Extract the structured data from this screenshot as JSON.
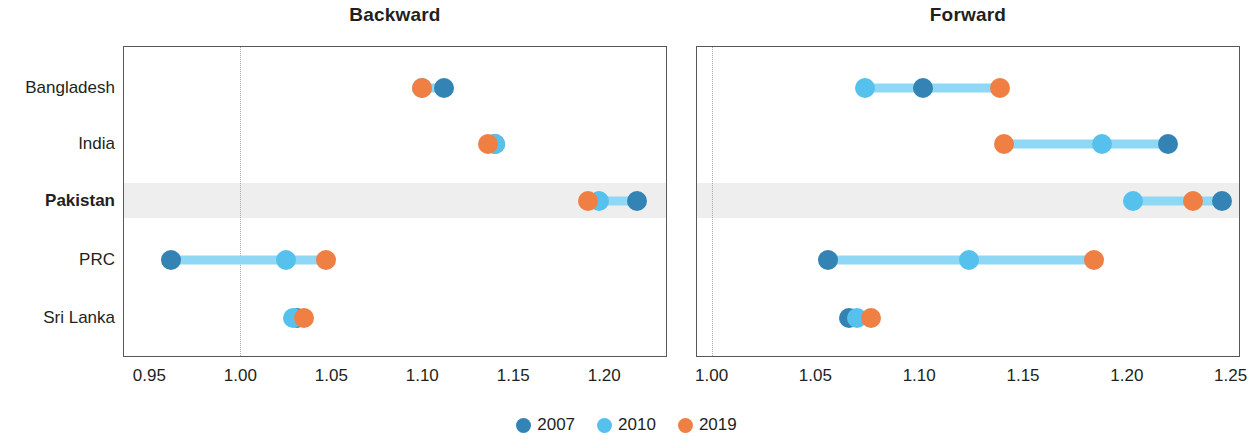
{
  "chart_data": {
    "type": "scatter",
    "subtype": "dumbbell-dot-plot",
    "title": "",
    "panels": [
      {
        "title": "Backward",
        "xlabel": "",
        "ylabel": "",
        "xlim": [
          0.9355,
          1.2345
        ],
        "xticks": [
          0.95,
          1.0,
          1.05,
          1.1,
          1.15,
          1.2
        ],
        "xticklabels": [
          "0.95",
          "1.00",
          "1.05",
          "1.10",
          "1.15",
          "1.20"
        ],
        "reference_line": 1.0,
        "grid": false,
        "categories": [
          "Bangladesh",
          "India",
          "Pakistan",
          "PRC",
          "Sri Lanka"
        ],
        "series": [
          {
            "name": "2007",
            "values": [
              1.112,
              1.14,
              1.218,
              0.962,
              1.031
            ]
          },
          {
            "name": "2010",
            "values": [
              1.1,
              1.14,
              1.197,
              1.025,
              1.029
            ]
          },
          {
            "name": "2019",
            "values": [
              1.1,
              1.136,
              1.191,
              1.047,
              1.035
            ]
          }
        ]
      },
      {
        "title": "Forward",
        "xlabel": "",
        "ylabel": "",
        "xlim": [
          0.9925,
          1.2545
        ],
        "xticks": [
          1.0,
          1.05,
          1.1,
          1.15,
          1.2,
          1.25
        ],
        "xticklabels": [
          "1.00",
          "1.05",
          "1.10",
          "1.15",
          "1.20",
          "1.25"
        ],
        "reference_line": 1.0,
        "grid": false,
        "categories": [
          "Bangladesh",
          "India",
          "Pakistan",
          "PRC",
          "Sri Lanka"
        ],
        "series": [
          {
            "name": "2007",
            "values": [
              1.102,
              1.22,
              1.246,
              1.056,
              1.066
            ]
          },
          {
            "name": "2010",
            "values": [
              1.074,
              1.188,
              1.203,
              1.124,
              1.07
            ]
          },
          {
            "name": "2019",
            "values": [
              1.139,
              1.141,
              1.232,
              1.184,
              1.077
            ]
          }
        ]
      }
    ],
    "highlight_category": "Pakistan",
    "legend": {
      "position": "bottom-center",
      "entries": [
        {
          "label": "2007",
          "color": "#3383b4"
        },
        {
          "label": "2010",
          "color": "#56c1ec"
        },
        {
          "label": "2019",
          "color": "#f07f43"
        }
      ]
    },
    "colors": {
      "2007": "#3383b4",
      "2010": "#56c1ec",
      "2019": "#f07f43",
      "connector": "#8ed8f5",
      "highlight_band": "#ebebec",
      "axis": "#58585a",
      "reference_line": "#a7a9ac",
      "text": "#231f20",
      "background": "#ffffff"
    }
  }
}
